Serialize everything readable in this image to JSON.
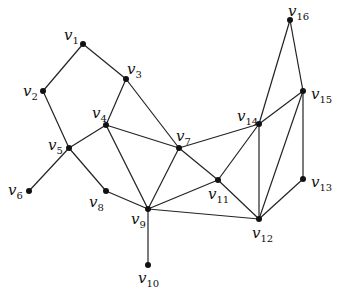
{
  "diagram": {
    "type": "undirected-graph",
    "nodes": [
      {
        "id": "v1",
        "base": "v",
        "sub": "1",
        "x": 83,
        "y": 44,
        "lx": 64,
        "ly": 40
      },
      {
        "id": "v2",
        "base": "v",
        "sub": "2",
        "x": 43,
        "y": 91,
        "lx": 23,
        "ly": 96
      },
      {
        "id": "v3",
        "base": "v",
        "sub": "3",
        "x": 126,
        "y": 79,
        "lx": 127,
        "ly": 74
      },
      {
        "id": "v4",
        "base": "v",
        "sub": "4",
        "x": 106,
        "y": 125,
        "lx": 92,
        "ly": 118
      },
      {
        "id": "v5",
        "base": "v",
        "sub": "5",
        "x": 69,
        "y": 148,
        "lx": 48,
        "ly": 150
      },
      {
        "id": "v6",
        "base": "v",
        "sub": "6",
        "x": 29,
        "y": 191,
        "lx": 8,
        "ly": 195
      },
      {
        "id": "v7",
        "base": "v",
        "sub": "7",
        "x": 179,
        "y": 148,
        "lx": 176,
        "ly": 141
      },
      {
        "id": "v8",
        "base": "v",
        "sub": "8",
        "x": 106,
        "y": 191,
        "lx": 89,
        "ly": 207
      },
      {
        "id": "v9",
        "base": "v",
        "sub": "9",
        "x": 148,
        "y": 209,
        "lx": 131,
        "ly": 224
      },
      {
        "id": "v10",
        "base": "v",
        "sub": "10",
        "x": 148,
        "y": 265,
        "lx": 138,
        "ly": 283
      },
      {
        "id": "v11",
        "base": "v",
        "sub": "11",
        "x": 218,
        "y": 180,
        "lx": 208,
        "ly": 199
      },
      {
        "id": "v12",
        "base": "v",
        "sub": "12",
        "x": 259,
        "y": 219,
        "lx": 252,
        "ly": 238
      },
      {
        "id": "v13",
        "base": "v",
        "sub": "13",
        "x": 303,
        "y": 179,
        "lx": 311,
        "ly": 187
      },
      {
        "id": "v14",
        "base": "v",
        "sub": "14",
        "x": 259,
        "y": 124,
        "lx": 237,
        "ly": 121
      },
      {
        "id": "v15",
        "base": "v",
        "sub": "15",
        "x": 303,
        "y": 91,
        "lx": 311,
        "ly": 99
      },
      {
        "id": "v16",
        "base": "v",
        "sub": "16",
        "x": 290,
        "y": 20,
        "lx": 288,
        "ly": 16
      }
    ],
    "edges": [
      [
        "v1",
        "v2"
      ],
      [
        "v1",
        "v3"
      ],
      [
        "v2",
        "v5"
      ],
      [
        "v3",
        "v4"
      ],
      [
        "v3",
        "v7"
      ],
      [
        "v4",
        "v5"
      ],
      [
        "v4",
        "v7"
      ],
      [
        "v4",
        "v9"
      ],
      [
        "v5",
        "v6"
      ],
      [
        "v5",
        "v8"
      ],
      [
        "v8",
        "v9"
      ],
      [
        "v9",
        "v10"
      ],
      [
        "v9",
        "v7"
      ],
      [
        "v9",
        "v11"
      ],
      [
        "v9",
        "v12"
      ],
      [
        "v7",
        "v14"
      ],
      [
        "v7",
        "v11"
      ],
      [
        "v11",
        "v14"
      ],
      [
        "v11",
        "v12"
      ],
      [
        "v14",
        "v12"
      ],
      [
        "v14",
        "v15"
      ],
      [
        "v14",
        "v16"
      ],
      [
        "v16",
        "v15"
      ],
      [
        "v15",
        "v12"
      ],
      [
        "v15",
        "v13"
      ],
      [
        "v13",
        "v12"
      ]
    ]
  }
}
